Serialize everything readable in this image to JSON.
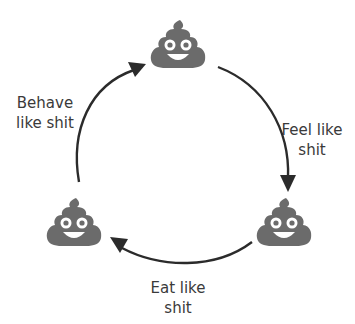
{
  "diagram": {
    "type": "cycle",
    "colors": {
      "emoji_fill": "#6b6b6b",
      "emoji_eye": "#ffffff",
      "arrow": "#2b2b2b",
      "text": "#3a3a3a",
      "background": "#ffffff"
    },
    "nodes": [
      {
        "id": "top",
        "icon": "poop-emoji-icon"
      },
      {
        "id": "right",
        "icon": "poop-emoji-icon"
      },
      {
        "id": "left",
        "icon": "poop-emoji-icon"
      }
    ],
    "edges": [
      {
        "from": "left",
        "to": "top",
        "label_line1": "Behave",
        "label_line2": "like shit"
      },
      {
        "from": "top",
        "to": "right",
        "label_line1": "Feel like",
        "label_line2": "shit"
      },
      {
        "from": "right",
        "to": "left",
        "label_line1": "Eat like",
        "label_line2": "shit"
      }
    ]
  }
}
